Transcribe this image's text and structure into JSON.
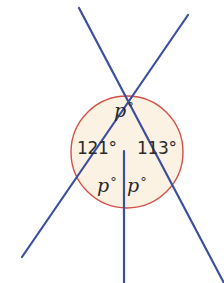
{
  "diagram": {
    "type": "angles-at-a-point",
    "colors": {
      "lines": "#3b4f9e",
      "circle_stroke": "#d2524a",
      "circle_fill": "#fbf2e3",
      "text": "#2a2a2a"
    },
    "circle": {
      "cx": 127,
      "cy": 152,
      "r": 56
    },
    "intersection": {
      "x": 124,
      "y": 151
    },
    "lines": [
      {
        "x1": 79,
        "y1": 8,
        "x2": 224,
        "y2": 283
      },
      {
        "x1": 188,
        "y1": 15,
        "x2": 22,
        "y2": 257
      },
      {
        "x1": 124,
        "y1": 151,
        "x2": 124,
        "y2": 283
      }
    ],
    "labels": {
      "top": {
        "var": "p",
        "deg": "°"
      },
      "left": "121°",
      "right": "113°",
      "bottom_left": {
        "var": "p",
        "deg": "°"
      },
      "bottom_right": {
        "var": "p",
        "deg": "°"
      }
    }
  }
}
